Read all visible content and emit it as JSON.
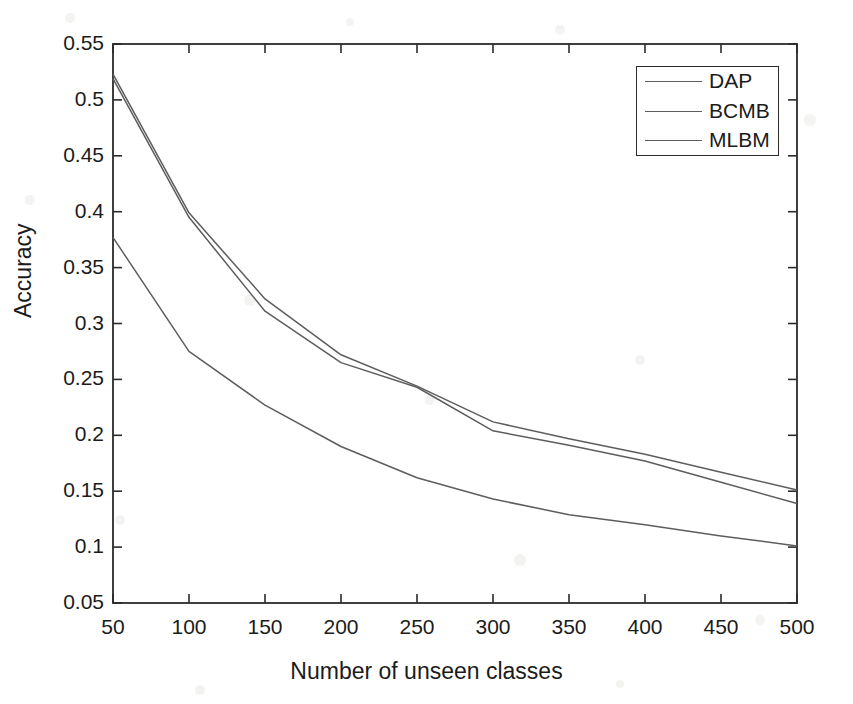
{
  "figure": {
    "background_color": "#ffffff",
    "axis_color": "#2b2b2b",
    "text_color": "#1b1b1b"
  },
  "chart_data": {
    "type": "line",
    "title": "",
    "xlabel": "Number of unseen classes",
    "ylabel": "Accuracy",
    "x": [
      50,
      100,
      150,
      200,
      250,
      300,
      350,
      400,
      450,
      500
    ],
    "xlim": [
      50,
      500
    ],
    "ylim": [
      0.05,
      0.55
    ],
    "xticks": [
      50,
      100,
      150,
      200,
      250,
      300,
      350,
      400,
      450,
      500
    ],
    "xtick_labels": [
      "50",
      "100",
      "150",
      "200",
      "250",
      "300",
      "350",
      "400",
      "450",
      "500"
    ],
    "yticks": [
      0.05,
      0.1,
      0.15,
      0.2,
      0.25,
      0.3,
      0.35,
      0.4,
      0.45,
      0.5,
      0.55
    ],
    "ytick_labels": [
      "0.05",
      "0.1",
      "0.15",
      "0.2",
      "0.25",
      "0.3",
      "0.35",
      "0.4",
      "0.45",
      "0.5",
      "0.55"
    ],
    "grid": false,
    "legend_position": "upper right",
    "series": [
      {
        "name": "DAP",
        "color": "#5d5d5d",
        "values": [
          0.523,
          0.399,
          0.322,
          0.272,
          0.244,
          0.212,
          0.197,
          0.183,
          0.167,
          0.151
        ]
      },
      {
        "name": "BCMB",
        "color": "#5d5d5d",
        "values": [
          0.519,
          0.395,
          0.311,
          0.265,
          0.243,
          0.204,
          0.191,
          0.177,
          0.158,
          0.139
        ]
      },
      {
        "name": "MLBM",
        "color": "#5d5d5d",
        "values": [
          0.377,
          0.275,
          0.227,
          0.19,
          0.162,
          0.143,
          0.129,
          0.12,
          0.11,
          0.101
        ]
      }
    ]
  },
  "legend": {
    "entries": [
      {
        "label": "DAP"
      },
      {
        "label": "BCMB"
      },
      {
        "label": "MLBM"
      }
    ]
  }
}
